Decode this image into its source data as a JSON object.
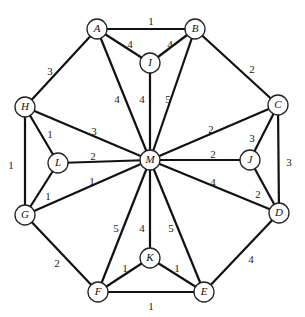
{
  "graph": {
    "nodes": [
      {
        "id": "A",
        "x": 97,
        "y": 29
      },
      {
        "id": "B",
        "x": 195,
        "y": 29
      },
      {
        "id": "I",
        "x": 150,
        "y": 63
      },
      {
        "id": "H",
        "x": 25,
        "y": 107
      },
      {
        "id": "C",
        "x": 278,
        "y": 105
      },
      {
        "id": "L",
        "x": 58,
        "y": 163
      },
      {
        "id": "M",
        "x": 150,
        "y": 160
      },
      {
        "id": "J",
        "x": 250,
        "y": 160
      },
      {
        "id": "G",
        "x": 25,
        "y": 215
      },
      {
        "id": "D",
        "x": 279,
        "y": 213
      },
      {
        "id": "K",
        "x": 150,
        "y": 258
      },
      {
        "id": "F",
        "x": 98,
        "y": 292
      },
      {
        "id": "E",
        "x": 204,
        "y": 292
      }
    ],
    "edges": [
      {
        "from": "A",
        "to": "B",
        "weight": "1",
        "lx": 151,
        "ly": 22
      },
      {
        "from": "A",
        "to": "I",
        "weight": "4",
        "lx": 130,
        "ly": 45
      },
      {
        "from": "I",
        "to": "B",
        "weight": "4",
        "lx": 170,
        "ly": 45
      },
      {
        "from": "A",
        "to": "H",
        "weight": "3",
        "lx": 50,
        "ly": 72
      },
      {
        "from": "A",
        "to": "M",
        "weight": "4",
        "lx": 117,
        "ly": 100
      },
      {
        "from": "I",
        "to": "M",
        "weight": "4",
        "lx": 142,
        "ly": 100
      },
      {
        "from": "B",
        "to": "M",
        "weight": "5",
        "lx": 168,
        "ly": 100
      },
      {
        "from": "B",
        "to": "C",
        "weight": "2",
        "lx": 252,
        "ly": 70
      },
      {
        "from": "H",
        "to": "M",
        "weight": "3",
        "lx": 94,
        "ly": 132
      },
      {
        "from": "H",
        "to": "L",
        "weight": "1",
        "lx": 50,
        "ly": 135
      },
      {
        "from": "H",
        "to": "G",
        "weight": "1",
        "lx": 11,
        "ly": 166
      },
      {
        "from": "L",
        "to": "M",
        "weight": "2",
        "lx": 93,
        "ly": 157
      },
      {
        "from": "L",
        "to": "G",
        "weight": "1",
        "lx": 48,
        "ly": 197
      },
      {
        "from": "G",
        "to": "M",
        "weight": "1",
        "lx": 92,
        "ly": 182
      },
      {
        "from": "G",
        "to": "F",
        "weight": "2",
        "lx": 57,
        "ly": 264
      },
      {
        "from": "C",
        "to": "M",
        "weight": "2",
        "lx": 211,
        "ly": 130
      },
      {
        "from": "C",
        "to": "J",
        "weight": "3",
        "lx": 252,
        "ly": 139
      },
      {
        "from": "C",
        "to": "D",
        "weight": "3",
        "lx": 289,
        "ly": 163
      },
      {
        "from": "M",
        "to": "J",
        "weight": "2",
        "lx": 213,
        "ly": 155
      },
      {
        "from": "J",
        "to": "D",
        "weight": "2",
        "lx": 258,
        "ly": 195
      },
      {
        "from": "M",
        "to": "D",
        "weight": "4",
        "lx": 213,
        "ly": 183
      },
      {
        "from": "M",
        "to": "F",
        "weight": "5",
        "lx": 116,
        "ly": 229
      },
      {
        "from": "M",
        "to": "K",
        "weight": "4",
        "lx": 142,
        "ly": 229
      },
      {
        "from": "M",
        "to": "E",
        "weight": "5",
        "lx": 171,
        "ly": 229
      },
      {
        "from": "K",
        "to": "F",
        "weight": "1",
        "lx": 125,
        "ly": 269
      },
      {
        "from": "K",
        "to": "E",
        "weight": "1",
        "lx": 177,
        "ly": 269
      },
      {
        "from": "F",
        "to": "E",
        "weight": "1",
        "lx": 151,
        "ly": 307
      },
      {
        "from": "D",
        "to": "E",
        "weight": "4",
        "lx": 251,
        "ly": 260
      }
    ],
    "node_radius": 10
  }
}
